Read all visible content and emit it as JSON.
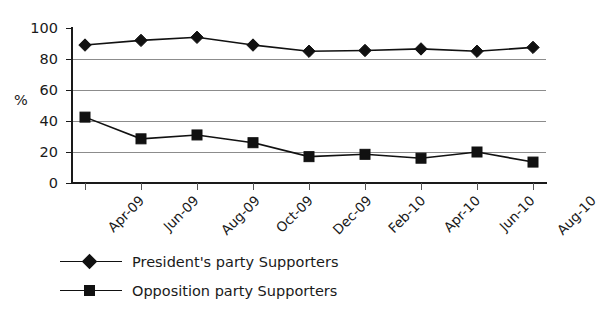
{
  "chart_data": {
    "type": "line",
    "title": "",
    "xlabel": "",
    "ylabel": "%",
    "ylim": [
      0,
      100
    ],
    "yticks": [
      0,
      20,
      40,
      60,
      80,
      100
    ],
    "grid": true,
    "legend_position": "bottom-left",
    "categories": [
      "Apr-09",
      "Jun-09",
      "Aug-09",
      "Oct-09",
      "Dec-09",
      "Feb-10",
      "Apr-10",
      "Jun-10",
      "Aug-10"
    ],
    "series": [
      {
        "name": "President's party Supporters",
        "marker": "diamond",
        "color": "#111111",
        "values": [
          89,
          92,
          94,
          89,
          85,
          85.5,
          86.5,
          85,
          87.5
        ]
      },
      {
        "name": "Opposition party Supporters",
        "marker": "square",
        "color": "#111111",
        "values": [
          42.5,
          28.5,
          31,
          26,
          17,
          18.5,
          16,
          20,
          13.5
        ]
      }
    ]
  },
  "axis": {
    "y_title": "%",
    "y_tick_labels": [
      "100",
      "80",
      "60",
      "40",
      "20",
      "0"
    ],
    "x_tick_labels": [
      "Apr-09",
      "Jun-09",
      "Aug-09",
      "Oct-09",
      "Dec-09",
      "Feb-10",
      "Apr-10",
      "Jun-10",
      "Aug-10"
    ]
  },
  "legend": {
    "items": [
      {
        "label": "President's party Supporters",
        "marker": "diamond-marker-icon"
      },
      {
        "label": "Opposition party Supporters",
        "marker": "square-marker-icon"
      }
    ]
  }
}
